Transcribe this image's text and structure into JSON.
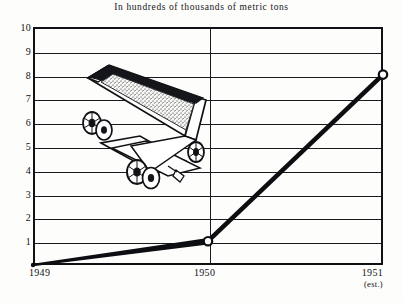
{
  "chart_data": {
    "type": "line",
    "title": "In hundreds of thousands of metric tons",
    "xlabel": "",
    "ylabel": "",
    "categories": [
      "1949",
      "1950",
      "1951"
    ],
    "x_tick_labels": [
      "1949",
      "1950",
      "1951"
    ],
    "x_tick_sublabels": [
      "",
      "",
      "(est.)"
    ],
    "values": [
      0,
      1,
      8
    ],
    "series": [
      {
        "name": "Production",
        "values": [
          0,
          1,
          8
        ]
      }
    ],
    "ylim": [
      0,
      10
    ],
    "y_ticks": [
      1,
      2,
      3,
      4,
      5,
      6,
      7,
      8,
      9,
      10
    ],
    "y_tick_labels": [
      "1",
      "2",
      "3",
      "4",
      "5",
      "6",
      "7",
      "8",
      "9",
      "10"
    ],
    "grid": "horizontal-and-vertical",
    "legend": "none",
    "markers": [
      {
        "label": "1949",
        "value": 0,
        "style": "dot"
      },
      {
        "label": "1950",
        "value": 1,
        "style": "circle"
      },
      {
        "label": "1951",
        "value": 8,
        "style": "circle"
      }
    ],
    "line_color": "#0d0e11",
    "grid_color": "#191a1d",
    "frame_color": "#101114",
    "background_color": "#fdfdfb",
    "annotations": [
      {
        "name": "ore-cart-illustration",
        "description": "mining ore cart filled with ore"
      }
    ]
  },
  "icons": {
    "cart": "ore-cart-icon"
  }
}
